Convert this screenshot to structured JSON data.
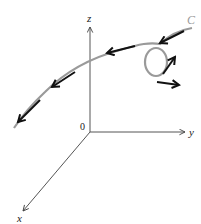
{
  "diagram": {
    "type": "3d-space-curve-with-tangent-vectors",
    "axes": {
      "x_label": "x",
      "y_label": "y",
      "z_label": "z",
      "origin_label": "0"
    },
    "curve": {
      "label": "C",
      "color": "#9a9a9a"
    },
    "vectors": {
      "color": "#111111",
      "count": 7,
      "description": "Tangent/field vectors along the curve, pointing from the C end toward the lower-left end; two vectors radiate outward from the loop"
    },
    "axis_color": "#555555"
  }
}
